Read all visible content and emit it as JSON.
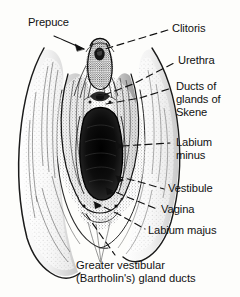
{
  "figure": {
    "background_color": "#fdfdfb",
    "ink_color": "#111111",
    "width": 240,
    "height": 297
  },
  "labels": {
    "prepuce": "Prepuce",
    "clitoris": "Clitoris",
    "urethra": "Urethra",
    "ducts_of_glands_of_skene": "Ducts of\nglands of\nSkene",
    "labium_minus": "Labium\nminus",
    "vestibule": "Vestibule",
    "vagina": "Vagina",
    "labium_majus": "Labium majus"
  },
  "caption": {
    "text": "Greater vestibular\n(Bartholin's) gland ducts"
  },
  "leaders": [
    {
      "name": "prepuce",
      "style": "solid-arrow",
      "points": "58,38 86,48",
      "arrow_at": "end"
    },
    {
      "name": "clitoris",
      "style": "dashed",
      "points": "95,53 170,31",
      "arrow_at": "none"
    },
    {
      "name": "urethra",
      "style": "dashed",
      "points": "99,74 176,62",
      "arrow_at": "none"
    },
    {
      "name": "ducts-of-glands-of-skene",
      "style": "dashed",
      "points": "101,98 172,87",
      "arrow_at": "none"
    },
    {
      "name": "labium-minus",
      "style": "dashed",
      "points": "118,147 170,143",
      "arrow_at": "none"
    },
    {
      "name": "vestibule",
      "style": "dashed",
      "points": "117,172 165,188",
      "arrow_at": "none"
    },
    {
      "name": "vagina",
      "style": "dashed",
      "points": "108,186 158,208",
      "arrow_at": "none"
    },
    {
      "name": "labium-majus",
      "style": "dashed",
      "points": "96,200 146,228",
      "arrow_at": "none"
    },
    {
      "name": "greater-vestibular-gland-ducts",
      "style": "dashed",
      "points": "88,212 116,256",
      "arrow_at": "none"
    }
  ],
  "illustration": {
    "name": "vulva-anatomical-drawing",
    "regions": [
      "labium-majus-outer-fold",
      "labium-minus-inner-fold",
      "clitoral-prepuce",
      "urethral-meatus",
      "vaginal-introitus",
      "vestibule-floor"
    ]
  }
}
